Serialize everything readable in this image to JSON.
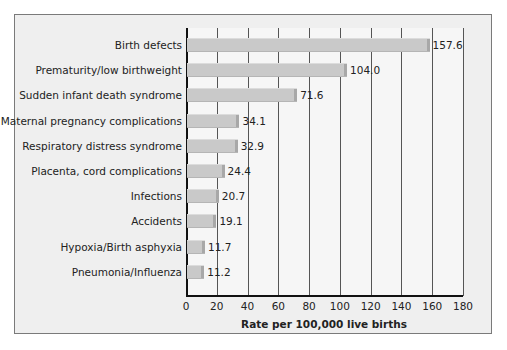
{
  "chart_data": {
    "type": "bar",
    "orientation": "horizontal",
    "title": "",
    "xlabel": "Rate per 100,000 live births",
    "ylabel": "",
    "xlim": [
      0,
      180
    ],
    "xticks": [
      0,
      20,
      40,
      60,
      80,
      100,
      120,
      140,
      160,
      180
    ],
    "grid": "vertical",
    "legend": null,
    "categories": [
      "Birth defects",
      "Prematurity/low birthweight",
      "Sudden infant death syndrome",
      "Maternal pregnancy complications",
      "Respiratory distress syndrome",
      "Placenta, cord complications",
      "Infections",
      "Accidents",
      "Hypoxia/Birth asphyxia",
      "Pneumonia/Influenza"
    ],
    "values": [
      157.6,
      104.0,
      71.6,
      34.1,
      32.9,
      24.4,
      20.7,
      19.1,
      11.7,
      11.2
    ],
    "value_labels": [
      "157.6",
      "104.0",
      "71.6",
      "34.1",
      "32.9",
      "24.4",
      "20.7",
      "19.1",
      "11.7",
      "11.2"
    ]
  },
  "colors": {
    "bar": "#c9c9c9",
    "frame_bg": "#efefef",
    "plot_bg": "#f6f6f6",
    "axis": "#111111"
  }
}
